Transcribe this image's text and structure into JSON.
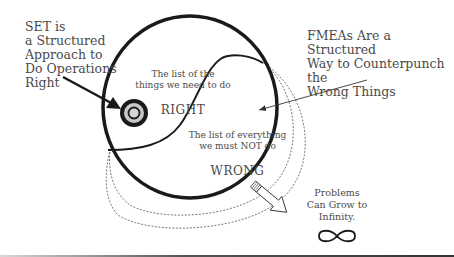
{
  "diagram": {
    "set_callout": {
      "text": "SET is\na Structured\nApproach to\nDo Operations\nRight"
    },
    "fmea_callout": {
      "text": "FMEAs Are a Structured\nWay to Counterpunch the\nWrong Things"
    },
    "right_zone": {
      "description": "The list of the\nthings we need to do",
      "keyword": "RIGHT"
    },
    "wrong_zone": {
      "description": "The list of everything\nwe must NOT do",
      "keyword": "WRONG"
    },
    "problems_callout": {
      "text": "Problems\nCan Grow to\nInfinity."
    },
    "icons": {
      "target": "target-icon",
      "infinity": "infinity-icon",
      "growth_arrow": "hollow-arrow-icon"
    },
    "colors": {
      "stroke": "#1a1a1a",
      "text": "#4a4a4a",
      "target_fill": "#c8c8c8",
      "dashed": "#555555"
    }
  }
}
